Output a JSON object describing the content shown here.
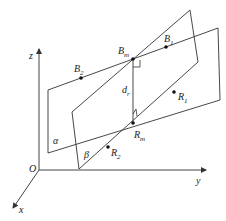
{
  "figure": {
    "axes": {
      "x": "x",
      "y": "y",
      "z": "z",
      "origin": "O"
    },
    "planes": {
      "alpha": "α",
      "beta": "β"
    },
    "points": {
      "B1": {
        "base": "B",
        "sub": "1"
      },
      "B2": {
        "base": "B",
        "sub": "2"
      },
      "Bm": {
        "base": "B",
        "sub": "m"
      },
      "R1": {
        "base": "R",
        "sub": "1"
      },
      "R2": {
        "base": "R",
        "sub": "2"
      },
      "Rm": {
        "base": "R",
        "sub": "m"
      }
    },
    "distance": {
      "base": "d",
      "sub": "r"
    },
    "colors": {
      "line": "#333333",
      "axis": "#444444",
      "background": "#ffffff"
    }
  }
}
